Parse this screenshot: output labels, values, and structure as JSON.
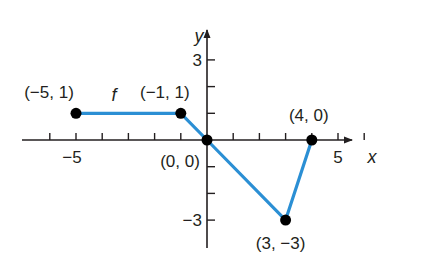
{
  "chart_data": {
    "type": "line",
    "title": "",
    "function_label": "f",
    "xlabel": "x",
    "ylabel": "y",
    "xlim": [
      -7,
      6
    ],
    "ylim": [
      -4,
      4
    ],
    "x_ticks": [
      -6,
      -5,
      -4,
      -3,
      -2,
      -1,
      1,
      2,
      3,
      4,
      5,
      6
    ],
    "y_ticks": [
      -3,
      -2,
      -1,
      1,
      2,
      3
    ],
    "x_tick_labels": [
      {
        "value": -5,
        "label": "−5"
      },
      {
        "value": 5,
        "label": "5"
      }
    ],
    "y_tick_labels": [
      {
        "value": 3,
        "label": "3"
      },
      {
        "value": -3,
        "label": "−3"
      }
    ],
    "grid": false,
    "series": [
      {
        "name": "f",
        "color": "#2b8fd4",
        "points": [
          {
            "x": -5,
            "y": 1,
            "label": "(−5, 1)"
          },
          {
            "x": -1,
            "y": 1,
            "label": "(−1, 1)"
          },
          {
            "x": 0,
            "y": 0,
            "label": "(0, 0)"
          },
          {
            "x": 3,
            "y": -3,
            "label": "(3, −3)"
          },
          {
            "x": 4,
            "y": 0,
            "label": "(4, 0)"
          }
        ]
      }
    ]
  }
}
